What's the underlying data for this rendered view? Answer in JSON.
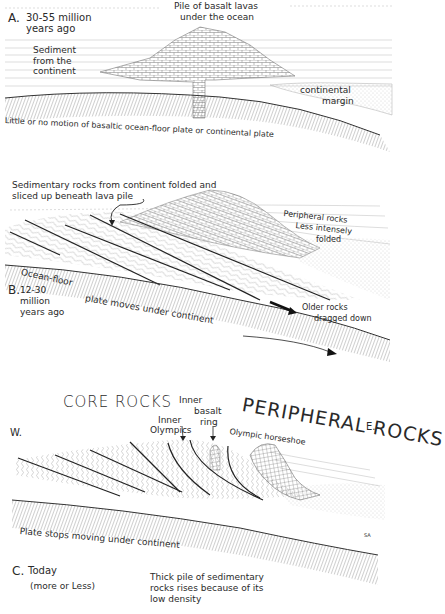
{
  "figure": {
    "type": "geologic cross-section sequence",
    "panels": [
      {
        "id": "A",
        "letter": "A.",
        "time": "30-55 million",
        "time2": "years ago",
        "labels": {
          "pile_line1": "Pile of basalt lavas",
          "pile_line2": "under the ocean",
          "sediment_line1": "Sediment",
          "sediment_line2": "from the",
          "sediment_line3": "continent",
          "margin_line1": "continental",
          "margin_line2": "margin",
          "plate_text": "Little or no motion of basaltic ocean-floor plate or continental plate"
        }
      },
      {
        "id": "B",
        "letter": "B.",
        "time": "12-30",
        "time2": "million",
        "time3": "years ago",
        "labels": {
          "folded_line1": "Sedimentary rocks from continent folded and",
          "folded_line2": "sliced up beneath lava pile",
          "peripheral_line1": "Peripheral rocks",
          "peripheral_line2": "Less intensely",
          "peripheral_line3": "folded",
          "ocean_floor": "Ocean-floor",
          "plate_moves": "plate moves under continent",
          "older_line1": "Older rocks",
          "older_line2": "dragged down"
        }
      },
      {
        "id": "C",
        "letter": "C.",
        "time": "Today",
        "time2": "(more or Less)",
        "labels": {
          "core_rocks": "CORE ROCKS",
          "peripheral_rocks": "PERIPHERAL ROCKS",
          "west": "W.",
          "east": "E.",
          "inner_olympics_line1": "Inner",
          "inner_olympics_line2": "Olympics",
          "inner_basalt_line1": "Inner",
          "inner_basalt_line2": "basalt",
          "inner_basalt_line3": "ring",
          "horseshoe": "Olympic horseshoe",
          "plate_stops": "Plate stops moving under continent",
          "thick_line1": "Thick pile of sedimentary",
          "thick_line2": "rocks rises because of its",
          "thick_line3": "low density",
          "signature": "SA"
        }
      }
    ]
  },
  "colors": {
    "ink": "#2a2a2a",
    "hatch": "#777777",
    "paper": "#ffffff"
  }
}
